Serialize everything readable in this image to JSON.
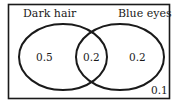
{
  "diagram": {
    "type": "venn",
    "universe": {
      "label": "",
      "outside_value": "0.1"
    },
    "sets": [
      {
        "name": "Dark hair",
        "only_value": "0.5"
      },
      {
        "name": "Blue eyes",
        "only_value": "0.2"
      }
    ],
    "intersection_value": "0.2",
    "colors": {
      "stroke": "#1a1a1a",
      "background": "#ffffff"
    }
  }
}
